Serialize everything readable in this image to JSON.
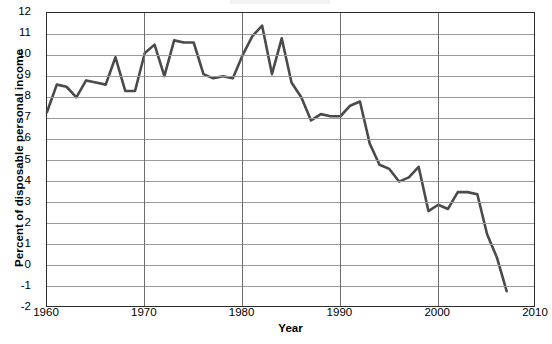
{
  "chart_data": {
    "type": "line",
    "title": "",
    "xlabel": "Year",
    "ylabel": "Percent of disposable personal income",
    "xlim": [
      1960,
      2010
    ],
    "ylim": [
      -2,
      12
    ],
    "xticks": [
      1960,
      1970,
      1980,
      1990,
      2000,
      2010
    ],
    "yticks": [
      -2,
      -1,
      0,
      1,
      2,
      3,
      4,
      5,
      6,
      7,
      8,
      9,
      10,
      11,
      12
    ],
    "grid": "horizontal-and-vertical",
    "legend": "none",
    "line_color": "#4a4a4a",
    "x": [
      1960,
      1961,
      1962,
      1963,
      1964,
      1965,
      1966,
      1967,
      1968,
      1969,
      1970,
      1971,
      1972,
      1973,
      1974,
      1975,
      1976,
      1977,
      1978,
      1979,
      1980,
      1981,
      1982,
      1983,
      1984,
      1985,
      1986,
      1987,
      1988,
      1989,
      1990,
      1991,
      1992,
      1993,
      1994,
      1995,
      1996,
      1997,
      1998,
      1999,
      2000,
      2001,
      2002,
      2003,
      2004,
      2005,
      2006,
      2007
    ],
    "series": [
      {
        "name": "Personal saving rate",
        "values": [
          7.3,
          8.6,
          8.5,
          8.0,
          8.8,
          8.7,
          8.6,
          9.9,
          8.3,
          8.3,
          10.1,
          10.5,
          9.0,
          10.7,
          10.6,
          10.6,
          9.1,
          8.9,
          9.0,
          8.9,
          10.0,
          10.9,
          11.4,
          9.1,
          10.8,
          8.7,
          8.0,
          6.9,
          7.2,
          7.1,
          7.1,
          7.6,
          7.8,
          5.8,
          4.8,
          4.6,
          4.0,
          4.2,
          4.7,
          2.6,
          2.9,
          2.7,
          3.5,
          3.5,
          3.4,
          1.5,
          0.4,
          -1.2
        ]
      }
    ]
  },
  "axis": {
    "y_label": "Percent of disposable personal income",
    "x_label": "Year",
    "y_tick_labels": [
      "12",
      "11",
      "10",
      "9",
      "8",
      "7",
      "6",
      "5",
      "4",
      "3",
      "2",
      "1",
      "0",
      "-1",
      "-2"
    ],
    "x_tick_labels": [
      "1960",
      "1970",
      "1980",
      "1990",
      "2000",
      "2010"
    ]
  }
}
